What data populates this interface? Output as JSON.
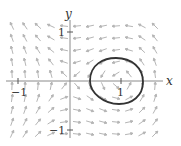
{
  "diagram": {
    "type": "direction-field-with-closed-orbit",
    "axes": {
      "x_label": "x",
      "y_label": "y",
      "x_ticks": [
        {
          "value": -1,
          "label": "−1"
        },
        {
          "value": 1,
          "label": "1"
        }
      ],
      "y_ticks": [
        {
          "value": 1,
          "label": "1"
        },
        {
          "value": -1,
          "label": "−1"
        }
      ],
      "x_range": [
        -1.4,
        1.6
      ],
      "y_range": [
        -1.1,
        1.1
      ]
    },
    "closed_orbit": {
      "description": "closed loop around point (1,0)",
      "x_extent": [
        0.4,
        1.45
      ],
      "y_extent": [
        -0.45,
        0.5
      ]
    },
    "colors": {
      "axis": "#8a8a8a",
      "arrows": "#b0b0b0",
      "orbit": "#333333",
      "text": "#333333"
    }
  }
}
